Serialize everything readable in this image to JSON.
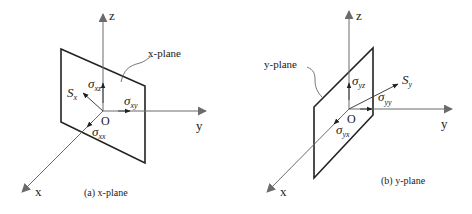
{
  "figure": {
    "panels": [
      {
        "id": "a",
        "caption": "(a) x-plane",
        "plane_label": "x-plane",
        "axes": {
          "z": "z",
          "y": "y",
          "x": "x",
          "origin": "O"
        },
        "vectors": {
          "resultant": "S",
          "resultant_sub": "x",
          "normal": "σ",
          "normal_sub": "xx",
          "shear_y": "σ",
          "shear_y_sub": "xy",
          "shear_z": "σ",
          "shear_z_sub": "xz"
        }
      },
      {
        "id": "b",
        "caption": "(b) y-plane",
        "plane_label": "y-plane",
        "axes": {
          "z": "z",
          "y": "y",
          "x": "x",
          "origin": "O"
        },
        "vectors": {
          "resultant": "S",
          "resultant_sub": "y",
          "normal": "σ",
          "normal_sub": "yy",
          "shear_x": "σ",
          "shear_x_sub": "yx",
          "shear_z": "σ",
          "shear_z_sub": "yz"
        }
      }
    ],
    "colors": {
      "axis": "#6b6b6b",
      "plane": "#222222",
      "text": "#222222"
    }
  }
}
